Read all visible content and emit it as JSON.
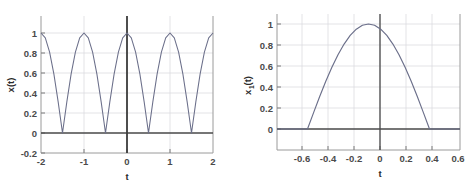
{
  "figure": {
    "background_color": "#ffffff",
    "panel_count": 2
  },
  "chart_data": [
    {
      "id": "left-plot",
      "type": "line",
      "title": "",
      "xlabel": "t",
      "ylabel": "x(t)",
      "xlim": [
        -2,
        2
      ],
      "ylim": [
        -0.2,
        1.1
      ],
      "xticks": [
        -2,
        -1,
        0,
        1,
        2
      ],
      "xtick_labels": [
        "-2",
        "-1",
        "0",
        "1",
        "2"
      ],
      "yticks": [
        -0.2,
        0,
        0.2,
        0.4,
        0.6,
        0.8,
        1
      ],
      "ytick_labels": [
        "-0.2",
        "0",
        "0.2",
        "0.4",
        "0.6",
        "0.8",
        "1"
      ],
      "grid": true,
      "legend": "none",
      "line_color": "#6b6f8a",
      "annotations": [
        "vertical axis line at t=0",
        "horizontal axis line at x(t)=0"
      ],
      "series": [
        {
          "name": "x(t) = |cos(pi*t)|",
          "description": "rectified cosine, period 1, peaks value 1 at t = -2,-1,0,1,2 and zeros at t = -1.5,-0.5,0.5,1.5",
          "x": [
            -2,
            -1.9,
            -1.8,
            -1.7,
            -1.6,
            -1.5,
            -1.4,
            -1.3,
            -1.2,
            -1.1,
            -1,
            -0.9,
            -0.8,
            -0.7,
            -0.6,
            -0.5,
            -0.4,
            -0.3,
            -0.2,
            -0.1,
            0,
            0.1,
            0.2,
            0.3,
            0.4,
            0.5,
            0.6,
            0.7,
            0.8,
            0.9,
            1,
            1.1,
            1.2,
            1.3,
            1.4,
            1.5,
            1.6,
            1.7,
            1.8,
            1.9,
            2
          ],
          "y": [
            1,
            0.951,
            0.809,
            0.588,
            0.309,
            0,
            0.309,
            0.588,
            0.809,
            0.951,
            1,
            0.951,
            0.809,
            0.588,
            0.309,
            0,
            0.309,
            0.588,
            0.809,
            0.951,
            1,
            0.951,
            0.809,
            0.588,
            0.309,
            0,
            0.309,
            0.588,
            0.809,
            0.951,
            1,
            0.951,
            0.809,
            0.588,
            0.309,
            0,
            0.309,
            0.588,
            0.809,
            0.951,
            1
          ]
        }
      ]
    },
    {
      "id": "right-plot",
      "type": "line",
      "title": "",
      "xlabel": "t",
      "ylabel": "x1(t)",
      "ylabel_base": "x",
      "ylabel_sub": "1",
      "ylabel_tail": "(t)",
      "xlim": [
        -0.75,
        0.75
      ],
      "ylim": [
        -0.12,
        1.1
      ],
      "xticks": [
        -0.6,
        -0.4,
        -0.2,
        0,
        0.2,
        0.4,
        0.6
      ],
      "xtick_labels": [
        "-0.6",
        "-0.4",
        "-0.2",
        "0",
        "0.2",
        "0.4",
        "0.6"
      ],
      "yticks": [
        0,
        0.2,
        0.4,
        0.6,
        0.8,
        1
      ],
      "ytick_labels": [
        "0",
        "0.2",
        "0.4",
        "0.6",
        "0.8",
        "1"
      ],
      "grid": true,
      "legend": "none",
      "line_color": "#6b6f8a",
      "annotations": [
        "vertical axis line at t=0",
        "horizontal axis line at x1(t)=0"
      ],
      "series": [
        {
          "name": "x1(t) = cos(pi*t) for |t| <= 0.5, else 0",
          "description": "single cosine lobe, peak 1 at t=0, zeros at t = -0.5 and t = 0.5, flat zero outside",
          "x": [
            -0.75,
            -0.7,
            -0.65,
            -0.6,
            -0.55,
            -0.5,
            -0.45,
            -0.4,
            -0.35,
            -0.3,
            -0.25,
            -0.2,
            -0.15,
            -0.1,
            -0.05,
            0,
            0.05,
            0.1,
            0.15,
            0.2,
            0.25,
            0.3,
            0.35,
            0.4,
            0.45,
            0.5,
            0.55,
            0.6,
            0.65,
            0.7,
            0.75
          ],
          "y": [
            0,
            0,
            0,
            0,
            0,
            0,
            0.156,
            0.309,
            0.454,
            0.588,
            0.707,
            0.809,
            0.891,
            0.951,
            0.988,
            1,
            0.988,
            0.951,
            0.891,
            0.809,
            0.707,
            0.588,
            0.454,
            0.309,
            0.156,
            0,
            0,
            0,
            0,
            0,
            0
          ]
        }
      ]
    }
  ],
  "left_plot": {
    "xlabel": "t",
    "ylabel": "x(t)",
    "xtick_labels": [
      "-2",
      "-1",
      "0",
      "1",
      "2"
    ],
    "ytick_labels": [
      "-0.2",
      "0",
      "0.2",
      "0.4",
      "0.6",
      "0.8",
      "1"
    ]
  },
  "right_plot": {
    "xlabel": "t",
    "ylabel_base": "x",
    "ylabel_sub": "1",
    "ylabel_tail": "(t)",
    "xtick_labels": [
      "-0.6",
      "-0.4",
      "-0.2",
      "0",
      "0.2",
      "0.4",
      "0.6"
    ],
    "ytick_labels": [
      "0",
      "0.2",
      "0.4",
      "0.6",
      "0.8",
      "1"
    ]
  },
  "colors": {
    "curve": "#6b6f8a",
    "axis_dark": "#4a4a4a",
    "grid": "#d8d8dc",
    "frame": "#9a9a9a",
    "background": "#ffffff"
  }
}
